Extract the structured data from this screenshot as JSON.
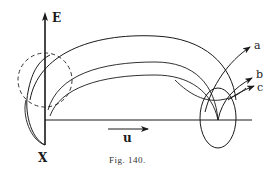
{
  "figure": {
    "caption": "Fig. 140.",
    "axis_labels": {
      "vertical": "E",
      "origin": "X",
      "velocity": "u"
    },
    "curve_labels": [
      "a",
      "b",
      "c"
    ],
    "colors": {
      "ink": "#1a1a1a",
      "background": "#ffffff"
    }
  }
}
